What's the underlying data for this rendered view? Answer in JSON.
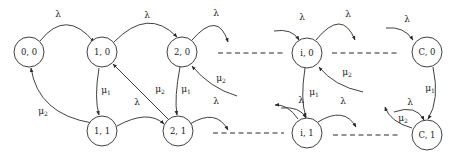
{
  "diagram": {
    "type": "state-transition-diagram",
    "colors": {
      "stroke": "#2b2b2b",
      "node_fill": "#ffffff",
      "background": "#ffffff",
      "label": "#1a1a1a"
    },
    "nodes": [
      {
        "id": "n00",
        "label": "0, 0",
        "cx": 29,
        "cy": 52,
        "r": 15
      },
      {
        "id": "n10",
        "label": "1, 0",
        "cx": 102,
        "cy": 52,
        "r": 15
      },
      {
        "id": "n20",
        "label": "2, 0",
        "cx": 182,
        "cy": 52,
        "r": 15
      },
      {
        "id": "ni0",
        "label": "i, 0",
        "cx": 307,
        "cy": 53,
        "r": 15
      },
      {
        "id": "nC0",
        "label": "C, 0",
        "cx": 427,
        "cy": 52,
        "r": 15
      },
      {
        "id": "n11",
        "label": "1, 1",
        "cx": 102,
        "cy": 131,
        "r": 15
      },
      {
        "id": "n21",
        "label": "2, 1",
        "cx": 178,
        "cy": 131,
        "r": 15
      },
      {
        "id": "ni1",
        "label": "i, 1",
        "cx": 307,
        "cy": 133,
        "r": 15
      },
      {
        "id": "nC1",
        "label": "C, 1",
        "cx": 427,
        "cy": 135,
        "r": 15
      }
    ],
    "edge_labels": [
      {
        "id": "l1",
        "sym": "λ",
        "sub": "",
        "x": 58,
        "y": 14
      },
      {
        "id": "l2",
        "sym": "λ",
        "sub": "",
        "x": 147,
        "y": 15
      },
      {
        "id": "l3",
        "sym": "λ",
        "sub": "",
        "x": 216,
        "y": 13
      },
      {
        "id": "l4",
        "sym": "λ",
        "sub": "",
        "x": 302,
        "y": 17
      },
      {
        "id": "l5",
        "sym": "λ",
        "sub": "",
        "x": 348,
        "y": 14
      },
      {
        "id": "l6",
        "sym": "λ",
        "sub": "",
        "x": 407,
        "y": 19
      },
      {
        "id": "l7",
        "sym": "μ",
        "sub": "2",
        "x": 43,
        "y": 111
      },
      {
        "id": "l8",
        "sym": "μ",
        "sub": "1",
        "x": 106,
        "y": 90
      },
      {
        "id": "l9",
        "sym": "λ",
        "sub": "",
        "x": 137,
        "y": 102
      },
      {
        "id": "l10",
        "sym": "μ",
        "sub": "2",
        "x": 160,
        "y": 89
      },
      {
        "id": "l11",
        "sym": "μ",
        "sub": "1",
        "x": 186,
        "y": 89
      },
      {
        "id": "l12",
        "sym": "λ",
        "sub": "",
        "x": 216,
        "y": 101
      },
      {
        "id": "l13",
        "sym": "μ",
        "sub": "2",
        "x": 221,
        "y": 78
      },
      {
        "id": "l14",
        "sym": "μ",
        "sub": "2",
        "x": 347,
        "y": 72
      },
      {
        "id": "l15",
        "sym": "μ",
        "sub": "1",
        "x": 314,
        "y": 92
      },
      {
        "id": "l16",
        "sym": "λ",
        "sub": "",
        "x": 301,
        "y": 100
      },
      {
        "id": "l17",
        "sym": "λ",
        "sub": "",
        "x": 343,
        "y": 101
      },
      {
        "id": "l18",
        "sym": "μ",
        "sub": "1",
        "x": 430,
        "y": 88
      },
      {
        "id": "l19",
        "sym": "λ",
        "sub": "",
        "x": 410,
        "y": 102
      },
      {
        "id": "l20",
        "sym": "μ",
        "sub": "2",
        "x": 403,
        "y": 118
      }
    ],
    "dashed_links": [
      {
        "id": "d1",
        "x1": 218,
        "y1": 53,
        "x2": 286,
        "y2": 53
      },
      {
        "id": "d2",
        "x1": 332,
        "y1": 53,
        "x2": 400,
        "y2": 53
      },
      {
        "id": "d3",
        "x1": 213,
        "y1": 133,
        "x2": 284,
        "y2": 133
      },
      {
        "id": "d4",
        "x1": 333,
        "y1": 135,
        "x2": 400,
        "y2": 135
      }
    ],
    "legend": {
      "arrival_rate": "λ",
      "service_rate_1": "μ1",
      "service_rate_2": "μ2"
    }
  }
}
